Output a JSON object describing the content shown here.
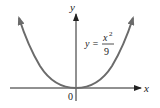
{
  "diagram": {
    "title": "",
    "axes": {
      "x_label": "x",
      "y_label": "y",
      "origin_label": "0"
    },
    "curve": {
      "equation_lhs": "y =",
      "numerator": "x",
      "exponent": "2",
      "denominator": "9",
      "type": "parabola",
      "vertex": [
        0,
        0
      ],
      "opens": "up"
    },
    "colors": {
      "curve": "#6b6b6b",
      "axes": "#222222",
      "text": "#222222"
    }
  }
}
